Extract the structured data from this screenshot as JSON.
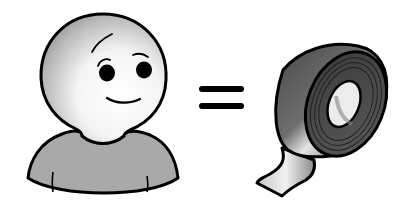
{
  "illustration": {
    "left": {
      "subject": "cartoon-person",
      "shirt_color": "#a9a9a9",
      "skin_highlight": "#ffffff",
      "skin_shade": "#8c8c8c"
    },
    "operator": {
      "symbol": "equals"
    },
    "right": {
      "subject": "roll-of-tape",
      "tape_color": "#5a5a5a",
      "tape_highlight": "#e6e6e6"
    },
    "outline_color": "#000000",
    "background": "#ffffff"
  }
}
